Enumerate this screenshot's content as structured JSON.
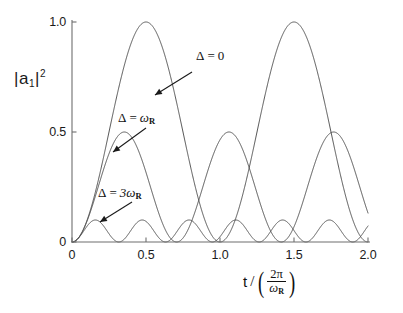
{
  "chart_data": {
    "type": "line",
    "title": "",
    "subtitle": "",
    "xlabel": "t / (2π/ω_R)",
    "ylabel": "|a₁|²",
    "xlim": [
      0,
      2.0
    ],
    "ylim": [
      0,
      1.0
    ],
    "grid": false,
    "legend_position": "inline-annotations",
    "xticks": [
      "0",
      "0.5",
      "1.0",
      "1.5",
      "2.0"
    ],
    "xtick_values": [
      0,
      0.5,
      1.0,
      1.5,
      2.0
    ],
    "yticks": [
      "0",
      "0.5",
      "1.0"
    ],
    "ytick_values": [
      0,
      0.5,
      1.0
    ],
    "formula": "|a1|^2 = (wR^2/(wR^2+D^2)) * sin^2( 0.5*sqrt(wR^2+D^2)*t )",
    "series": [
      {
        "name": "Δ = 0",
        "detuning_ratio": 0,
        "amplitude": 1.0,
        "period": 1.0,
        "peaks_x": [
          0.5,
          1.5
        ],
        "peak_value": 1.0,
        "zeros_x": [
          0,
          1.0,
          2.0
        ]
      },
      {
        "name": "Δ = ω_R",
        "detuning_ratio": 1,
        "amplitude": 0.5,
        "period": 0.7071,
        "peaks_x": [
          0.3536,
          1.0607,
          1.7678
        ],
        "peak_value": 0.5,
        "zeros_x": [
          0,
          0.7071,
          1.4142,
          2.1213
        ]
      },
      {
        "name": "Δ = 3ω_R",
        "detuning_ratio": 3,
        "amplitude": 0.1,
        "period": 0.3162,
        "peaks_x": [
          0.1581,
          0.4743,
          0.7906,
          1.1068,
          1.423,
          1.7393
        ],
        "peak_value": 0.1,
        "zeros_x": [
          0,
          0.3162,
          0.6325,
          0.9487,
          1.2649,
          1.5811,
          1.8974
        ]
      }
    ]
  },
  "axes": {
    "y_label_base": "a",
    "y_label_sub": "1",
    "y_label_sup": "2",
    "x_label_var": "t",
    "x_label_slash": "/",
    "x_label_numerator": "2π",
    "x_label_denominator": "ω",
    "x_label_denominator_sub": "R"
  },
  "annotations": [
    {
      "id": "annot-delta-zero",
      "delta": "Δ",
      "equals": "=",
      "value": "0",
      "value_sub": "",
      "text": "Δ = 0"
    },
    {
      "id": "annot-delta-omega",
      "delta": "Δ",
      "equals": "=",
      "value": "ω",
      "value_sub": "R",
      "text": "Δ = ωR"
    },
    {
      "id": "annot-delta-3omega",
      "delta": "Δ",
      "equals": "=",
      "value": "3ω",
      "value_sub": "R",
      "text": "Δ = 3ωR"
    }
  ],
  "colors": {
    "curve": "#4a4a4a",
    "axis": "#6e6e6e",
    "text": "#1a1a1a",
    "background": "#ffffff"
  }
}
